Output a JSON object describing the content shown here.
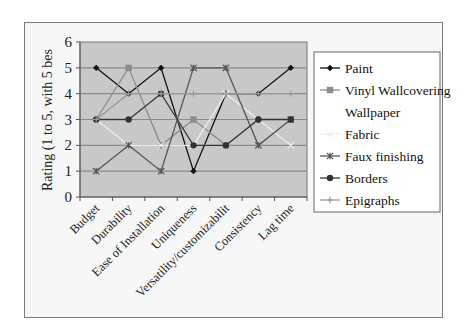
{
  "chart_data": {
    "type": "line",
    "title": "",
    "xlabel": "",
    "ylabel": "Rating (1 to 5, with 5 bes",
    "ylim": [
      0,
      6
    ],
    "yticks": [
      0,
      1,
      2,
      3,
      4,
      5,
      6
    ],
    "grid": true,
    "legend_position": "right",
    "categories": [
      "Budget",
      "Durability",
      "Ease of Installation",
      "Uniqueness",
      "Versatility/customizabilit",
      "Consistency",
      "Lag time"
    ],
    "series": [
      {
        "name": "Paint",
        "marker": "diamond",
        "color": "#111111",
        "values": [
          5,
          4,
          5,
          1,
          4,
          4,
          5
        ]
      },
      {
        "name": "Vinyl Wallcovering",
        "marker": "square",
        "color": "#8c8c8c",
        "values": [
          3,
          5,
          2,
          3,
          2,
          3,
          3
        ]
      },
      {
        "name": "Wallpaper",
        "marker": "none",
        "color": "#f2f2f2",
        "values": [
          3,
          3,
          4,
          2,
          2,
          3,
          3
        ]
      },
      {
        "name": "Fabric",
        "marker": "x",
        "color": "#eeeeee",
        "values": [
          3,
          2,
          2,
          2,
          4,
          3,
          2
        ]
      },
      {
        "name": "Faux finishing",
        "marker": "star",
        "color": "#555555",
        "values": [
          1,
          2,
          1,
          5,
          5,
          2,
          3
        ]
      },
      {
        "name": "Borders",
        "marker": "circle",
        "color": "#333333",
        "values": [
          3,
          3,
          4,
          2,
          2,
          3,
          3
        ]
      },
      {
        "name": "Epigraphs",
        "marker": "plus",
        "color": "#999999",
        "values": [
          3,
          4,
          4,
          4,
          4,
          4,
          4
        ]
      }
    ]
  },
  "colors": {
    "plot_bg": "#c8c8c8",
    "gridline": "#8a8a8a",
    "frame_bg": "#f7f7f7"
  }
}
